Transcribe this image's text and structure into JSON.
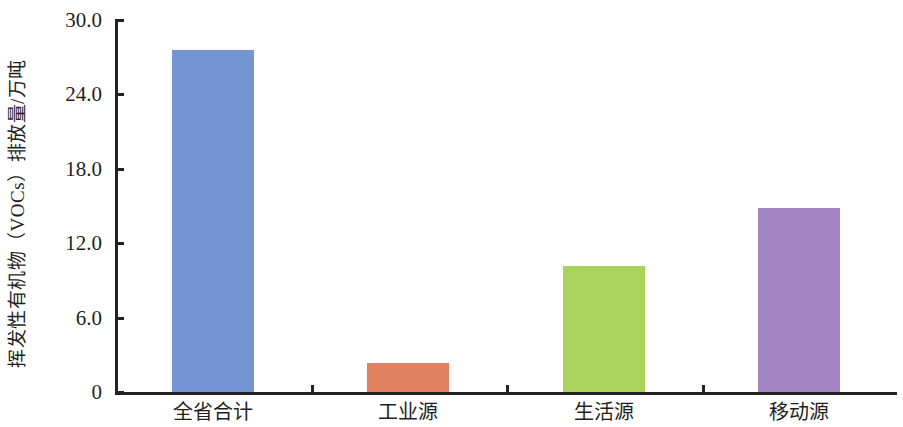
{
  "chart_data": {
    "type": "bar",
    "title": "",
    "xlabel": "",
    "ylabel": "挥发性有机物（VOCs）排放量/万吨",
    "categories": [
      "全省合计",
      "工业源",
      "生活源",
      "移动源"
    ],
    "values": [
      27.6,
      2.3,
      10.2,
      14.8
    ],
    "series": [
      {
        "name": "挥发性有机物（VOCs）排放量",
        "values": [
          27.6,
          2.3,
          10.2,
          14.8
        ]
      }
    ],
    "ylim": [
      0,
      30
    ],
    "ytick_labels": [
      "0",
      "6.0",
      "12.0",
      "18.0",
      "24.0",
      "30.0"
    ],
    "ytick_values": [
      0,
      6,
      12,
      18,
      24,
      30
    ],
    "grid": false,
    "legend": false,
    "legend_position": "none",
    "bar_colors": [
      "#7693d4",
      "#df7f5f",
      "#a9d35b",
      "#a484c3"
    ]
  },
  "axes": {
    "y_title": "挥发性有机物（VOCs）排放量/万吨",
    "ticks": [
      {
        "label": "30.0",
        "value": 30
      },
      {
        "label": "24.0",
        "value": 24
      },
      {
        "label": "18.0",
        "value": 18
      },
      {
        "label": "12.0",
        "value": 12
      },
      {
        "label": "6.0",
        "value": 6
      },
      {
        "label": "0",
        "value": 0
      }
    ]
  },
  "bars": [
    {
      "category": "全省合计",
      "value": 27.6,
      "color": "#7693d4"
    },
    {
      "category": "工业源",
      "value": 2.3,
      "color": "#df7f5f"
    },
    {
      "category": "生活源",
      "value": 10.2,
      "color": "#a9d35b"
    },
    {
      "category": "移动源",
      "value": 14.8,
      "color": "#a484c3"
    }
  ]
}
